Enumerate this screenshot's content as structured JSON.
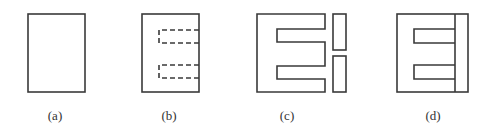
{
  "figure": {
    "stroke_color": "#3a3a3a",
    "background": "#ffffff",
    "panels": [
      {
        "id": "a",
        "label": "(a)",
        "content": "plain rectangle"
      },
      {
        "id": "b",
        "label": "(b)",
        "content": "rectangle with two dashed slot outlines opening on right edge"
      },
      {
        "id": "c",
        "label": "(c)",
        "content": "E-shaped core with two separate I bars"
      },
      {
        "id": "d",
        "label": "(d)",
        "content": "assembled E core closed by vertical I bar"
      }
    ]
  }
}
